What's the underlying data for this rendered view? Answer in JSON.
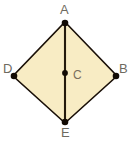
{
  "figure": {
    "type": "rhombus-with-vertical-diagonal",
    "shape_name": "rhombus ABED with center C",
    "fill_color": "#f8ecc4",
    "stroke_color": "#1a1008",
    "background_color": "#ffffff",
    "point_color": "#120b04",
    "label_color": "#6e6a60",
    "center_label_color": "#7a6f5d",
    "vertices": [
      {
        "id": "A",
        "label": "A",
        "x": 65,
        "y": 22,
        "role": "top-vertex"
      },
      {
        "id": "B",
        "label": "B",
        "x": 117,
        "y": 76,
        "role": "right-vertex"
      },
      {
        "id": "E",
        "label": "E",
        "x": 65,
        "y": 123,
        "role": "bottom-vertex"
      },
      {
        "id": "D",
        "label": "D",
        "x": 13,
        "y": 76,
        "role": "left-vertex"
      }
    ],
    "center": {
      "id": "C",
      "label": "C",
      "x": 65,
      "y": 73,
      "role": "center-point"
    },
    "segments": [
      {
        "id": "AB",
        "from": "A",
        "to": "B",
        "kind": "side"
      },
      {
        "id": "BE",
        "from": "B",
        "to": "E",
        "kind": "side"
      },
      {
        "id": "ED",
        "from": "E",
        "to": "D",
        "kind": "side"
      },
      {
        "id": "DA",
        "from": "D",
        "to": "A",
        "kind": "side"
      },
      {
        "id": "AE",
        "from": "A",
        "to": "E",
        "kind": "vertical-diagonal"
      }
    ]
  }
}
